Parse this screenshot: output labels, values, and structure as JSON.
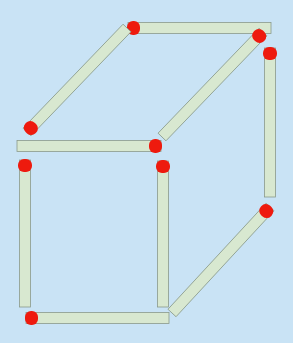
{
  "puzzle": {
    "title": "Matchstick cube",
    "match_count": 9,
    "colors": {
      "background": "#c9e3f5",
      "stick": "#d8e8d0",
      "stick_outline": "#8a9a8a",
      "head": "#ee1a0e"
    },
    "matches": [
      {
        "id": "top-horizontal",
        "x1": 128,
        "y1": 28,
        "x2": 271,
        "y2": 28,
        "head": "start"
      },
      {
        "id": "upper-left-diagonal",
        "x1": 27,
        "y1": 132,
        "x2": 127,
        "y2": 28,
        "head": "start"
      },
      {
        "id": "upper-right-diagonal",
        "x1": 263,
        "y1": 32,
        "x2": 162,
        "y2": 137,
        "head": "start"
      },
      {
        "id": "middle-horizontal",
        "x1": 17,
        "y1": 146,
        "x2": 161,
        "y2": 146,
        "head": "end"
      },
      {
        "id": "right-vertical",
        "x1": 270,
        "y1": 48,
        "x2": 270,
        "y2": 197,
        "head": "start"
      },
      {
        "id": "left-vertical",
        "x1": 25,
        "y1": 160,
        "x2": 25,
        "y2": 307,
        "head": "start"
      },
      {
        "id": "middle-vertical",
        "x1": 163,
        "y1": 161,
        "x2": 163,
        "y2": 307,
        "head": "start"
      },
      {
        "id": "bottom-horizontal",
        "x1": 26,
        "y1": 318,
        "x2": 169,
        "y2": 318,
        "head": "start"
      },
      {
        "id": "lower-right-diagonal",
        "x1": 270,
        "y1": 207,
        "x2": 172,
        "y2": 313,
        "head": "start"
      }
    ]
  }
}
